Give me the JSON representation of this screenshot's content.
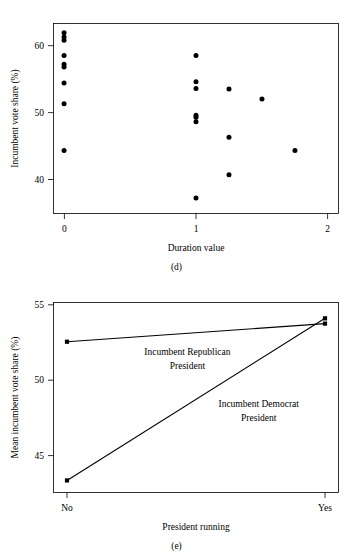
{
  "document": {
    "title": "Incumbent vote share figures (d) and (e)"
  },
  "chart_data": [
    {
      "id": "d",
      "type": "scatter",
      "title": "",
      "panel_label": "(d)",
      "xlabel": "Duration value",
      "ylabel": "Incumbent vote share (%)",
      "xlim": [
        -0.08,
        2.08
      ],
      "ylim": [
        35.2,
        63.6
      ],
      "xticks": [
        0,
        1,
        2
      ],
      "xticklabels": [
        "0",
        "1",
        "2"
      ],
      "yticks": [
        40,
        50,
        60
      ],
      "yticklabels": [
        "40",
        "50",
        "60"
      ],
      "grid": false,
      "legend": "none",
      "points": [
        {
          "x": 0.0,
          "y": 62.2
        },
        {
          "x": 0.0,
          "y": 61.6
        },
        {
          "x": 0.0,
          "y": 61.1
        },
        {
          "x": 0.0,
          "y": 58.8
        },
        {
          "x": 0.0,
          "y": 57.5
        },
        {
          "x": 0.0,
          "y": 57.1
        },
        {
          "x": 0.0,
          "y": 54.7
        },
        {
          "x": 0.0,
          "y": 51.6
        },
        {
          "x": 0.0,
          "y": 44.6
        },
        {
          "x": 1.0,
          "y": 58.8
        },
        {
          "x": 1.0,
          "y": 54.9
        },
        {
          "x": 1.0,
          "y": 53.9
        },
        {
          "x": 1.0,
          "y": 49.9
        },
        {
          "x": 1.0,
          "y": 49.6
        },
        {
          "x": 1.0,
          "y": 48.9
        },
        {
          "x": 1.0,
          "y": 37.5
        },
        {
          "x": 1.25,
          "y": 53.8
        },
        {
          "x": 1.25,
          "y": 46.6
        },
        {
          "x": 1.25,
          "y": 41.0
        },
        {
          "x": 1.5,
          "y": 52.3
        },
        {
          "x": 1.75,
          "y": 44.6
        }
      ]
    },
    {
      "id": "e",
      "type": "line",
      "title": "",
      "panel_label": "(e)",
      "xlabel": "President running",
      "ylabel": "Mean incumbent vote share (%)",
      "categories": [
        "No",
        "Yes"
      ],
      "xticklabels": [
        "No",
        "Yes"
      ],
      "yticks": [
        45,
        50,
        55
      ],
      "yticklabels": [
        "45",
        "50",
        "55"
      ],
      "ylim": [
        42.9,
        55.5
      ],
      "grid": false,
      "legend": "inline-annotations",
      "series": [
        {
          "name": "Incumbent Republican President",
          "values": [
            52.9,
            54.1
          ],
          "annotation": {
            "lines": [
              "Incumbent Republican",
              "President"
            ],
            "x_frac": 0.47,
            "y_value": 52.0
          }
        },
        {
          "name": "Incumbent Democrat President",
          "values": [
            43.7,
            54.45
          ],
          "annotation": {
            "lines": [
              "Incumbent Democrat",
              "President"
            ],
            "x_frac": 0.72,
            "y_value": 48.6
          }
        }
      ]
    }
  ],
  "figure_d": {
    "ylabel": "Incumbent vote share (%)",
    "xlabel": "Duration value",
    "panel_label": "(d)",
    "xtick_0": "0",
    "xtick_1": "1",
    "xtick_2": "2",
    "ytick_40": "40",
    "ytick_50": "50",
    "ytick_60": "60"
  },
  "figure_e": {
    "ylabel": "Mean incumbent vote share (%)",
    "xlabel": "President running",
    "panel_label": "(e)",
    "xtick_no": "No",
    "xtick_yes": "Yes",
    "ytick_45": "45",
    "ytick_50": "50",
    "ytick_55": "55",
    "annot_rep_line1": "Incumbent Republican",
    "annot_rep_line2": "President",
    "annot_dem_line1": "Incumbent Democrat",
    "annot_dem_line2": "President"
  },
  "colors": {
    "ink": "#000000",
    "background": "#ffffff"
  }
}
